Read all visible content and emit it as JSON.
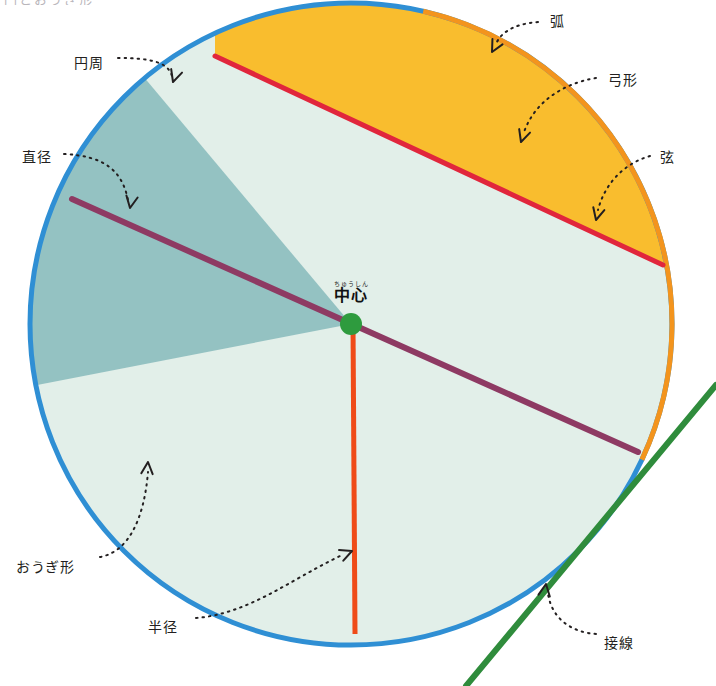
{
  "figure": {
    "title_strip": "円とおうぎ形",
    "canvas": {
      "width": 716,
      "height": 686
    },
    "circle": {
      "cx": 351,
      "cy": 324,
      "r": 321
    },
    "colors": {
      "circumference_stroke": "#2f8fd4",
      "circle_fill": "#e2efe9",
      "arc_stroke": "#f3941d",
      "segment_fill": "#f9bd2e",
      "chord_stroke": "#e1263c",
      "diameter_stroke": "#8e3a63",
      "radius_stroke": "#ef4b18",
      "sector_fill": "#8fbfc0",
      "tangent_stroke": "#2f8c3c",
      "center_dot": "#2e9b3e",
      "leader_line": "#231f20",
      "label_text": "#231f20"
    }
  },
  "labels": {
    "circumference": {
      "text": "円周",
      "x": 74,
      "y": 56
    },
    "diameter": {
      "text": "直径",
      "x": 22,
      "y": 150
    },
    "sector": {
      "text": "おうぎ形",
      "x": 16,
      "y": 560
    },
    "radius": {
      "text": "半径",
      "x": 148,
      "y": 620
    },
    "arc": {
      "text": "弧",
      "x": 550,
      "y": 14
    },
    "segment": {
      "text": "弓形",
      "x": 608,
      "y": 73
    },
    "chord": {
      "text": "弦",
      "x": 660,
      "y": 150
    },
    "tangent": {
      "text": "接線",
      "x": 604,
      "y": 636
    },
    "center": {
      "ruby": "ちゅうしん",
      "text": "中心",
      "x": 351,
      "y": 281
    }
  },
  "geometry": {
    "chord": {
      "x1": 215,
      "y1": 56,
      "x2": 663,
      "y2": 265
    },
    "diameter": {
      "x1": 72,
      "y1": 199,
      "x2": 638,
      "y2": 452
    },
    "radius": {
      "x1": 353,
      "y1": 324,
      "x2": 355,
      "y2": 634
    },
    "tangent": {
      "x1": 716,
      "y1": 385,
      "x2": 466,
      "y2": 686
    },
    "tangent_point": {
      "x": 600,
      "y": 516
    },
    "arc_highlight": {
      "start_deg": -77,
      "end_deg": 25
    },
    "sector": {
      "start_deg": 169,
      "end_deg": 230
    }
  },
  "leaders": {
    "circumference": {
      "path": "M 118 58 C 150 58, 168 62, 172 76",
      "tip": {
        "x": 173,
        "y": 82
      },
      "angle": 108
    },
    "diameter": {
      "path": "M 64 154 C 104 156, 122 170, 128 200",
      "tip": {
        "x": 130,
        "y": 208
      },
      "angle": 100
    },
    "sector": {
      "path": "M 100 557 C 128 552, 144 520, 148 472",
      "tip": {
        "x": 148,
        "y": 462
      },
      "angle": -85
    },
    "radius": {
      "path": "M 196 618 C 248 614, 290 580, 340 556",
      "tip": {
        "x": 352,
        "y": 551
      },
      "angle": -22
    },
    "arc": {
      "path": "M 538 22 C 512 24, 500 34, 496 44",
      "tip": {
        "x": 492,
        "y": 52
      },
      "angle": 118
    },
    "segment": {
      "path": "M 596 78 C 560 84, 534 104, 524 132",
      "tip": {
        "x": 521,
        "y": 142
      },
      "angle": 108
    },
    "chord": {
      "path": "M 650 156 C 622 164, 604 186, 598 210",
      "tip": {
        "x": 596,
        "y": 220
      },
      "angle": 104
    },
    "tangent": {
      "path": "M 596 634 C 570 632, 552 618, 548 594",
      "tip": {
        "x": 546,
        "y": 584
      },
      "angle": -81
    }
  }
}
